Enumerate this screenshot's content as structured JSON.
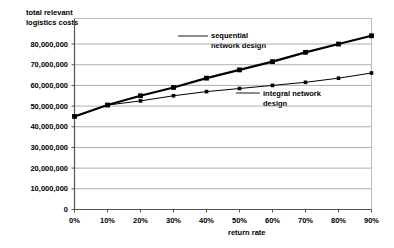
{
  "chart_data": {
    "type": "line",
    "title": "",
    "xlabel": "return rate",
    "ylabel": "total relevant logistics costs",
    "x": [
      0,
      10,
      20,
      30,
      40,
      50,
      60,
      70,
      80,
      90
    ],
    "xtick_labels": [
      "0%",
      "10%",
      "20%",
      "30%",
      "40%",
      "50%",
      "60%",
      "70%",
      "80%",
      "90%"
    ],
    "ytick_labels": [
      "0",
      "10,000,000",
      "20,000,000",
      "30,000,000",
      "40,000,000",
      "50,000,000",
      "60,000,000",
      "70,000,000",
      "80,000,000"
    ],
    "ytick_values": [
      0,
      10000000,
      20000000,
      30000000,
      40000000,
      50000000,
      60000000,
      70000000,
      80000000
    ],
    "xlim": [
      0,
      90
    ],
    "ylim": [
      0,
      88000000
    ],
    "grid": true,
    "legend_position": "inline-annotation",
    "series": [
      {
        "name": "sequential network design",
        "values": [
          45000000,
          50500000,
          55000000,
          59000000,
          63500000,
          67500000,
          71500000,
          76000000,
          80000000,
          84000000
        ],
        "color": "#000000",
        "line_width": 2.2,
        "marker": "square"
      },
      {
        "name": "integral network design",
        "values": [
          45000000,
          50500000,
          52500000,
          55000000,
          57000000,
          58500000,
          60000000,
          61500000,
          63500000,
          66000000
        ],
        "color": "#000000",
        "line_width": 1.0,
        "marker": "square"
      }
    ]
  },
  "labels": {
    "ylabel_line1": "total relevant",
    "ylabel_line2": "logistics costs",
    "xlabel": "return rate",
    "series_sequential_line1": "sequential",
    "series_sequential_line2": "network design",
    "series_integral_line1": "integral network",
    "series_integral_line2": "design"
  }
}
